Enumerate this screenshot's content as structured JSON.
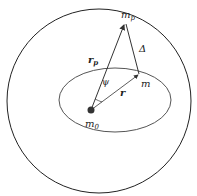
{
  "diagram": {
    "labels": {
      "planet": "m",
      "planet_sub": "p",
      "central": "m",
      "central_sub": "0",
      "body": "m",
      "rp_vec": "r",
      "rp_sub": "p",
      "r_vec": "r",
      "delta": "Δ",
      "angle": "ψ"
    },
    "colors": {
      "outer_circle": "#222222",
      "ellipse": "#555555",
      "vectors": "#333333",
      "central_body": "#333333"
    }
  }
}
